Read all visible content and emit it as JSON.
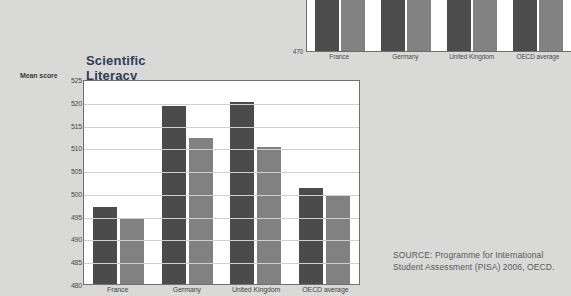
{
  "page": {
    "background_color": "#d9d9d7",
    "source_note": "SOURCE: Programme for International Student Assessment (PISA) 2006, OECD."
  },
  "chart_data": [
    {
      "id": "main",
      "type": "bar",
      "title": "Scientific Literacy",
      "xlabel": "",
      "ylabel": "Mean score",
      "ylim": [
        480,
        525
      ],
      "ytick_step": 5,
      "ticks": [
        "525",
        "520",
        "515",
        "510",
        "505",
        "500",
        "495",
        "490",
        "485",
        "480"
      ],
      "categories": [
        "France",
        "Germany",
        "United Kingdom",
        "OECD average"
      ],
      "grid": true,
      "legend": "none",
      "series": [
        {
          "name": "Boys",
          "color": "#4b4b4b",
          "values": [
            497,
            519,
            520,
            501
          ]
        },
        {
          "name": "Girls",
          "color": "#818181",
          "values": [
            494.5,
            512,
            510,
            499.5
          ]
        }
      ]
    },
    {
      "id": "top-cropped",
      "type": "bar",
      "title": "",
      "note": "Partially cropped chart above; only the lower axis region is visible.",
      "ylim": [
        470,
        482
      ],
      "ytick_step": 5,
      "ticks": [
        "480",
        "475",
        "470"
      ],
      "categories": [
        "France",
        "Germany",
        "United Kingdom",
        "OECD average"
      ],
      "grid": true,
      "series": [
        {
          "name": "Boys",
          "color": "#4c4c4c",
          "values": [
            482,
            482,
            482,
            482
          ]
        },
        {
          "name": "Girls",
          "color": "#828282",
          "values": [
            482,
            482,
            482,
            482
          ]
        }
      ]
    }
  ]
}
